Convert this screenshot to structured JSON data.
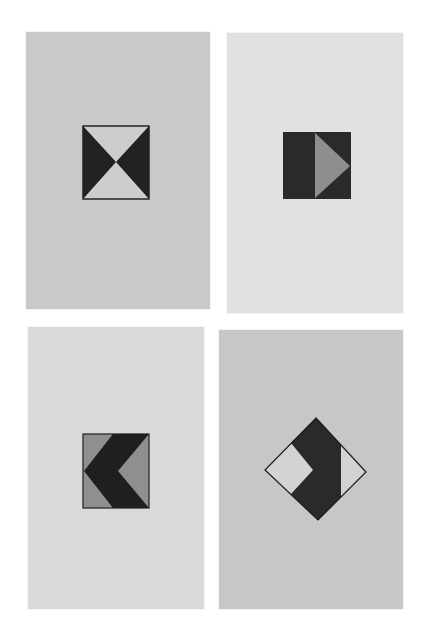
{
  "scene": {
    "description": "Four cards, each with a geometric black/gray/white motif",
    "background": "#ffffff"
  },
  "cards": [
    {
      "id": "card-1",
      "motif": "hourglass-square",
      "x": 26,
      "y": 32,
      "w": 184,
      "h": 277,
      "fill": "#c9c9c9",
      "pattern": {
        "frame": [
          83,
          126,
          66,
          73
        ],
        "dark": "#222222",
        "light": "#cdcdcd"
      }
    },
    {
      "id": "card-2",
      "motif": "play-arrow-square",
      "x": 227,
      "y": 33,
      "w": 176,
      "h": 280,
      "fill": "#e1e1e1",
      "pattern": {
        "frame": [
          283,
          132,
          68,
          67
        ],
        "dark": "#2a2a2a",
        "mid": "#8e8e8e"
      }
    },
    {
      "id": "card-3",
      "motif": "left-chevron-square",
      "x": 28,
      "y": 327,
      "w": 176,
      "h": 282,
      "fill": "#d9d9d9",
      "pattern": {
        "frame": [
          83,
          434,
          66,
          74
        ],
        "dark": "#1f1f1f",
        "mid": "#8f8f8f"
      }
    },
    {
      "id": "card-4",
      "motif": "diamond-with-notch",
      "x": 219,
      "y": 330,
      "w": 184,
      "h": 279,
      "fill": "#c7c7c7",
      "pattern": {
        "top": [
          316,
          418
        ],
        "left": [
          265,
          470
        ],
        "right": [
          366,
          472
        ],
        "bottom": [
          318,
          520
        ],
        "dark": "#2a2a2a",
        "light": "#d3d3d3"
      }
    }
  ]
}
